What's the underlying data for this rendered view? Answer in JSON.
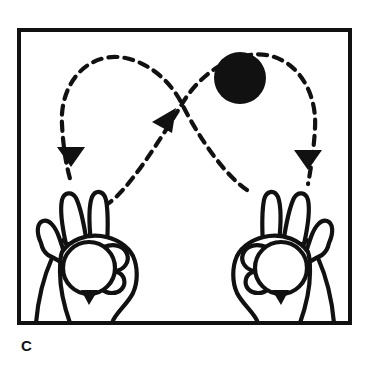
{
  "figure": {
    "panel_label": "C",
    "title": "Juggling pattern diagram – two hands, three-ball cascade crossing motion",
    "background_color": "#ffffff",
    "ink_color": "#111111",
    "frame": {
      "x": 17,
      "y": 28,
      "width": 335,
      "height": 297,
      "stroke_width": 4,
      "stroke_color": "#111111",
      "fill": "#ffffff"
    },
    "airborne_ball": {
      "name": "ball-in-air",
      "cx": 240,
      "cy": 78,
      "r": 26,
      "fill": "#111111"
    },
    "held_balls": [
      {
        "name": "ball-in-left-hand",
        "cx": 89,
        "cy": 268,
        "r": 26,
        "fill": "#ffffff",
        "stroke": "#111111"
      },
      {
        "name": "ball-in-right-hand",
        "cx": 281,
        "cy": 268,
        "r": 26,
        "fill": "#ffffff",
        "stroke": "#111111"
      }
    ],
    "trajectories": [
      {
        "name": "left-throw-arc",
        "description": "dashed arc rising from left hand, crossing centre, looping over to the left and descending",
        "dash_pattern": "9 7",
        "stroke_width": 4
      },
      {
        "name": "right-throw-arc",
        "description": "dashed arc rising from right hand, crossing centre, looping over to the right and descending",
        "dash_pattern": "9 7",
        "stroke_width": 4
      }
    ],
    "arrowheads": [
      {
        "name": "arrowhead-left-descending",
        "x": 71,
        "y": 156,
        "direction": "down"
      },
      {
        "name": "arrowhead-center-ascending",
        "x": 168,
        "y": 120,
        "direction": "up-right"
      },
      {
        "name": "arrowhead-right-descending",
        "x": 308,
        "y": 159,
        "direction": "down"
      }
    ],
    "hands": [
      {
        "name": "left-hand",
        "side": "left",
        "pose": "two-fingers-up-holding-ball"
      },
      {
        "name": "right-hand",
        "side": "right",
        "pose": "two-fingers-up-holding-ball"
      }
    ]
  }
}
